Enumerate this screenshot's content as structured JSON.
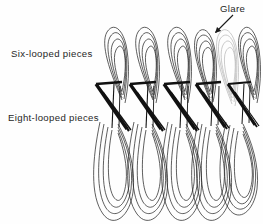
{
  "figure": {
    "background_color": "#fefefe",
    "width": 263,
    "height": 224,
    "ink_color": "#1a1a1a",
    "glare_color": "#b9b9b9",
    "text_color": "#272727"
  },
  "labels": {
    "six": "Six-looped pieces",
    "eight": "Eight-looped pieces",
    "glare": "Glare"
  },
  "annotation": {
    "arrow": {
      "name": "glare-arrow",
      "from_x": 233,
      "from_y": 15,
      "to_x": 214,
      "to_y": 34
    }
  },
  "diagram_data": {
    "type": "line",
    "description": "Two rows of nested elongated loops (hairpin curves) drawn as overlapping wire forms; upper row of six-looped pieces, lower row of eight-looped pieces, connected through dark zigzag crossings in the middle band.",
    "top_groups": 6,
    "bottom_groups": 5,
    "loops_per_top_group": 4,
    "loops_per_bottom_group": 4,
    "glare_group_index": 5,
    "top_group_x": [
      112,
      143,
      174,
      200,
      221,
      247
    ],
    "bottom_group_x": [
      118,
      152,
      186,
      216,
      243
    ],
    "top_band": [
      26,
      95
    ],
    "middle_band": [
      78,
      130
    ],
    "bottom_band": [
      128,
      222
    ]
  }
}
